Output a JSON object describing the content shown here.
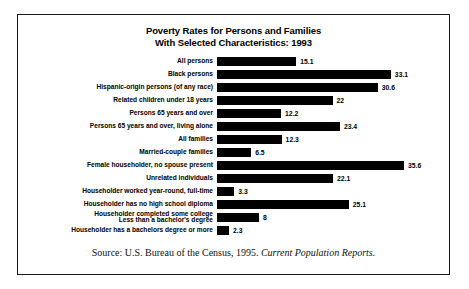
{
  "title": {
    "line1": "Poverty Rates for Persons and Families",
    "line2": "With Selected Characteristics: 1993"
  },
  "source": {
    "prefix": "Source: U.S. Bureau of the Census, 1995.",
    "publication": "Current Population Reports."
  },
  "colors": {
    "bar": "#000000",
    "border": "#1a1a1a",
    "text": "#000000",
    "background": "#ffffff"
  },
  "chart_data": {
    "type": "bar",
    "orientation": "horizontal",
    "title": "Poverty Rates for Persons and Families With Selected Characteristics: 1993",
    "xlabel": "",
    "ylabel": "",
    "xlim": [
      0,
      35.6
    ],
    "grid": false,
    "legend": false,
    "value_labels": true,
    "categories": [
      "All persons",
      "Black persons",
      "Hispanic-origin persons (of any race)",
      "Related children under 18 years",
      "Persons 65 years and over",
      "Persons 65 years and over, living alone",
      "All families",
      "Married-couple families",
      "Female householder, no spouse present",
      "Unrelated individuals",
      "Householder worked year-round, full-time",
      "Householder has no high school diploma",
      "Householder completed some college Less than a bachelor's degree",
      "Householder has a bachelors degree or more"
    ],
    "values": [
      15.1,
      33.1,
      30.6,
      22,
      12.2,
      23.4,
      12.3,
      6.5,
      35.6,
      22.1,
      3.3,
      25.1,
      8,
      2.3
    ],
    "value_display": [
      "15.1",
      "33.1",
      "30.6",
      "22",
      "12.2",
      "23.4",
      "12.3",
      "6.5",
      "35.6",
      "22.1",
      "3.3",
      "25.1",
      "8",
      "2.3"
    ]
  },
  "rows": [
    {
      "label": "All persons",
      "label2": "",
      "value": 15.1,
      "display": "15.1"
    },
    {
      "label": "Black persons",
      "label2": "",
      "value": 33.1,
      "display": "33.1"
    },
    {
      "label": "Hispanic-origin persons (of any race)",
      "label2": "",
      "value": 30.6,
      "display": "30.6"
    },
    {
      "label": "Related children under 18 years",
      "label2": "",
      "value": 22,
      "display": "22"
    },
    {
      "label": "Persons 65 years and over",
      "label2": "",
      "value": 12.2,
      "display": "12.2"
    },
    {
      "label": "Persons 65 years and over, living alone",
      "label2": "",
      "value": 23.4,
      "display": "23.4"
    },
    {
      "label": "All families",
      "label2": "",
      "value": 12.3,
      "display": "12.3"
    },
    {
      "label": "Married-couple families",
      "label2": "",
      "value": 6.5,
      "display": "6.5"
    },
    {
      "label": "Female householder, no spouse present",
      "label2": "",
      "value": 35.6,
      "display": "35.6"
    },
    {
      "label": "Unrelated individuals",
      "label2": "",
      "value": 22.1,
      "display": "22.1"
    },
    {
      "label": "Householder worked year-round, full-time",
      "label2": "",
      "value": 3.3,
      "display": "3.3"
    },
    {
      "label": "Householder has no high school diploma",
      "label2": "",
      "value": 25.1,
      "display": "25.1"
    },
    {
      "label": "Householder completed some college",
      "label2": "Less than a bachelor's degree",
      "value": 8,
      "display": "8"
    },
    {
      "label": "Householder has a bachelors degree or more",
      "label2": "",
      "value": 2.3,
      "display": "2.3"
    }
  ]
}
